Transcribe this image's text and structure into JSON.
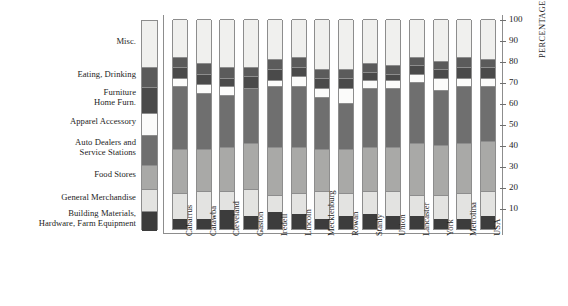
{
  "chart_data": {
    "type": "bar",
    "subtype": "stacked-percentage-bar",
    "title": "",
    "xlabel": "",
    "ylabel": "PERCENTAGE OF TOTAL",
    "ylim": [
      0,
      100
    ],
    "yticks": [
      10,
      20,
      30,
      40,
      50,
      60,
      70,
      80,
      90,
      100
    ],
    "ytick_labels": [
      "10",
      "20",
      "30",
      "40",
      "50",
      "60",
      "70",
      "80",
      "90",
      "100"
    ],
    "grid": false,
    "legend_position": "left",
    "stack_order_bottom_to_top": [
      "Building Materials, Hardware, Farm Equipment",
      "General Merchandise",
      "Food Stores",
      "Auto Dealers and Service Stations",
      "Apparel Accessory",
      "Furniture Home Furn.",
      "Eating, Drinking",
      "Misc."
    ],
    "categories": [
      "Cabarrus",
      "Catawba",
      "Cleveland",
      "Gaston",
      "Iredell",
      "Lincoln",
      "Mecklenburg",
      "Rowan",
      "Stanly",
      "Union",
      "Lancaster",
      "York",
      "Metrolina",
      "USA"
    ],
    "series": [
      {
        "name": "Building Materials, Hardware, Farm Equipment",
        "color": "#3c3c3c",
        "values": [
          5,
          5,
          9,
          6,
          8,
          7,
          5,
          6,
          7,
          6,
          6,
          5,
          5,
          6
        ]
      },
      {
        "name": "General Merchandise",
        "color": "#e3e3e1",
        "values": [
          12,
          13,
          9,
          13,
          8,
          10,
          13,
          11,
          11,
          12,
          10,
          11,
          12,
          12
        ]
      },
      {
        "name": "Food Stores",
        "color": "#a9a9a7",
        "values": [
          21,
          20,
          21,
          22,
          23,
          22,
          20,
          21,
          21,
          21,
          25,
          24,
          24,
          24
        ]
      },
      {
        "name": "Auto Dealers and Service Stations",
        "color": "#6f6f6f",
        "values": [
          30,
          27,
          25,
          26,
          29,
          29,
          25,
          22,
          28,
          28,
          29,
          26,
          27,
          26
        ]
      },
      {
        "name": "Apparel Accessory",
        "color": "#fbfbfa",
        "values": [
          4,
          4,
          4,
          0,
          3,
          5,
          4,
          7,
          4,
          4,
          4,
          6,
          4,
          4
        ]
      },
      {
        "name": "Furniture Home Furn.",
        "color": "#4a4a4a",
        "values": [
          5,
          5,
          4,
          6,
          5,
          4,
          5,
          5,
          4,
          3,
          4,
          4,
          5,
          5
        ]
      },
      {
        "name": "Eating, Drinking",
        "color": "#5b5b5b",
        "values": [
          5,
          5,
          5,
          4,
          5,
          5,
          4,
          4,
          4,
          4,
          4,
          4,
          5,
          4
        ]
      },
      {
        "name": "Misc.",
        "color": "#f0f0ee",
        "values": [
          18,
          21,
          23,
          23,
          19,
          18,
          24,
          24,
          21,
          22,
          18,
          20,
          18,
          19
        ]
      }
    ]
  },
  "legend": {
    "items": [
      {
        "label": "Misc.",
        "color": "#f0f0ee"
      },
      {
        "label": "Eating, Drinking",
        "color": "#5b5b5b"
      },
      {
        "label": "Furniture\nHome Furn.",
        "color": "#4a4a4a"
      },
      {
        "label": "Apparel Accessory",
        "color": "#fbfbfa"
      },
      {
        "label": "Auto Dealers and\nService Stations",
        "color": "#6f6f6f"
      },
      {
        "label": "Food Stores",
        "color": "#a9a9a7"
      },
      {
        "label": "General Merchandise",
        "color": "#e3e3e1"
      },
      {
        "label": "Building Materials,\nHardware, Farm Equipment",
        "color": "#3c3c3c"
      }
    ]
  },
  "axis": {
    "y_title": "PERCENTAGE OF TOTAL"
  },
  "colors": {
    "rule": "#8d8d8d",
    "text": "#1d1d1d",
    "background": "#ffffff"
  }
}
